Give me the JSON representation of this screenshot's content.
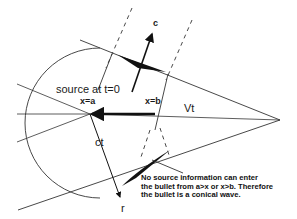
{
  "diagram": {
    "labels": {
      "source": "source at t=0",
      "x_a": "x=a",
      "x_b": "x=b",
      "vt": "Vt",
      "c": "c",
      "ct": "ct",
      "r": "r"
    },
    "note_lines": [
      "No source information can enter",
      "the bullet from a>x or x>b. Therefore",
      "the bullet is a conical wave."
    ],
    "colors": {
      "line": "#2a2a2a",
      "fill": "#111111",
      "background": "#ffffff"
    }
  }
}
